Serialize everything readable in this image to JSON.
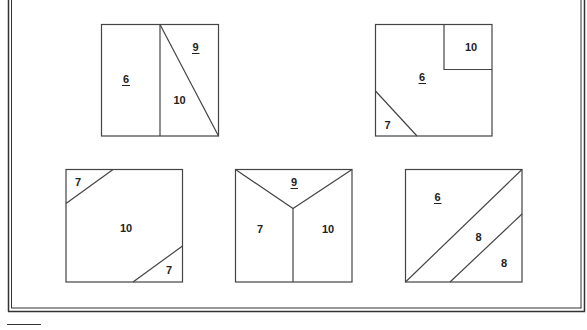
{
  "figure": {
    "squares": [
      {
        "id": "square-1",
        "position": "top-left",
        "regions": [
          {
            "label": "6",
            "underlined": true
          },
          {
            "label": "9",
            "underlined": true
          },
          {
            "label": "10",
            "underlined": false
          }
        ]
      },
      {
        "id": "square-2",
        "position": "top-right",
        "regions": [
          {
            "label": "10",
            "underlined": false
          },
          {
            "label": "6",
            "underlined": true
          },
          {
            "label": "7",
            "underlined": false
          }
        ]
      },
      {
        "id": "square-3",
        "position": "bottom-left",
        "regions": [
          {
            "label": "7",
            "underlined": false
          },
          {
            "label": "10",
            "underlined": false
          },
          {
            "label": "7",
            "underlined": false
          }
        ]
      },
      {
        "id": "square-4",
        "position": "bottom-middle",
        "regions": [
          {
            "label": "9",
            "underlined": true
          },
          {
            "label": "7",
            "underlined": false
          },
          {
            "label": "10",
            "underlined": false
          }
        ]
      },
      {
        "id": "square-5",
        "position": "bottom-right",
        "regions": [
          {
            "label": "6",
            "underlined": true
          },
          {
            "label": "8",
            "underlined": false
          },
          {
            "label": "8",
            "underlined": false
          }
        ]
      }
    ]
  },
  "colors": {
    "background": "#ffffff",
    "line": "#444444",
    "text": "#222222"
  }
}
